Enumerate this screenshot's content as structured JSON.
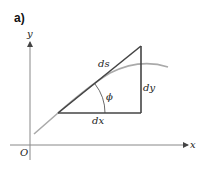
{
  "figure": {
    "panel_label": "a)",
    "axes": {
      "x_label": "x",
      "y_label": "y",
      "origin_label": "O"
    },
    "triangle": {
      "hypotenuse_label": "ds",
      "vertical_label": "dy",
      "horizontal_label": "dx",
      "angle_label": "ϕ"
    },
    "colors": {
      "axis": "#888888",
      "triangle": "#444444",
      "curve": "#aaaaaa",
      "text": "#222222"
    }
  }
}
